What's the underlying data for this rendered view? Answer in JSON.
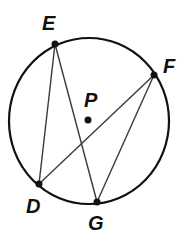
{
  "figure": {
    "circle": {
      "center_label": "P",
      "stroke": "#111111",
      "cx": 89,
      "cy": 121,
      "rx": 80,
      "ry": 83
    },
    "points": [
      {
        "label": "E",
        "x": 55,
        "y": 44,
        "label_x": 42,
        "label_y": 30
      },
      {
        "label": "F",
        "x": 154,
        "y": 75,
        "label_x": 163,
        "label_y": 73
      },
      {
        "label": "D",
        "x": 39,
        "y": 184,
        "label_x": 26,
        "label_y": 213
      },
      {
        "label": "G",
        "x": 97,
        "y": 202,
        "label_x": 88,
        "label_y": 230
      },
      {
        "label": "P",
        "x": 88,
        "y": 120,
        "label_x": 84,
        "label_y": 107
      }
    ],
    "segments": [
      {
        "from": "E",
        "to": "D"
      },
      {
        "from": "E",
        "to": "G"
      },
      {
        "from": "F",
        "to": "D"
      },
      {
        "from": "F",
        "to": "G"
      }
    ],
    "segment_color": "#3a3a3a"
  }
}
